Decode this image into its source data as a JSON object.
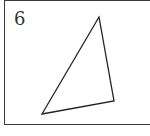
{
  "figure": {
    "label": "6",
    "shape": "triangle",
    "stroke_color": "#222222",
    "frame_color": "#3a3a3a",
    "vertices": {
      "top": [
        99,
        17
      ],
      "bottom_left": [
        42,
        114
      ],
      "bottom_right": [
        114,
        101
      ]
    }
  }
}
